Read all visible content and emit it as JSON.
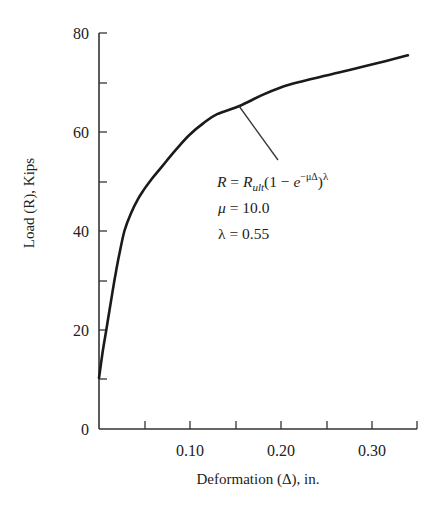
{
  "chart_data": {
    "type": "line",
    "title": "",
    "xlabel": "Deformation (Δ), in.",
    "ylabel": "Load (R), Kips",
    "xlim": [
      0,
      0.35
    ],
    "ylim": [
      0,
      80
    ],
    "grid": false,
    "legend": null,
    "x_ticks": [
      0.05,
      0.1,
      0.15,
      0.2,
      0.25,
      0.3,
      0.35
    ],
    "x_tick_labels": [
      {
        "value": 0.1,
        "label": "0.10"
      },
      {
        "value": 0.2,
        "label": "0.20"
      },
      {
        "value": 0.3,
        "label": "0.30"
      }
    ],
    "y_ticks": [
      10,
      20,
      30,
      40,
      50,
      60,
      70,
      80
    ],
    "y_tick_labels": [
      {
        "value": 0,
        "label": "0"
      },
      {
        "value": 20,
        "label": "20"
      },
      {
        "value": 40,
        "label": "40"
      },
      {
        "value": 60,
        "label": "60"
      },
      {
        "value": 80,
        "label": "80"
      }
    ],
    "series": [
      {
        "name": "Load-deformation curve",
        "x": [
          0.0,
          0.004,
          0.008,
          0.012,
          0.017,
          0.022,
          0.028,
          0.035,
          0.043,
          0.05,
          0.058,
          0.066,
          0.075,
          0.085,
          0.1,
          0.115,
          0.13,
          0.154,
          0.18,
          0.2,
          0.225,
          0.25,
          0.264,
          0.29,
          0.315,
          0.34
        ],
        "y": [
          10.3,
          15.5,
          20.0,
          24.5,
          30.0,
          35.0,
          40.0,
          43.5,
          46.5,
          48.5,
          50.5,
          52.3,
          54.3,
          56.5,
          59.5,
          61.8,
          63.6,
          65.2,
          67.5,
          69.0,
          70.3,
          71.4,
          72.0,
          73.2,
          74.3,
          75.5
        ]
      }
    ],
    "annotations": [
      {
        "text": "R = R_ult(1 − e^(−μΔ))^λ",
        "points_to": {
          "x": 0.153,
          "y": 65.2
        }
      },
      {
        "text": "μ = 10.0"
      },
      {
        "text": "λ = 0.55"
      }
    ]
  },
  "labels": {
    "x_axis_title": "Deformation (Δ), in.",
    "y_axis_title": "Load (R), Kips",
    "y_ticks": [
      "80",
      "60",
      "40",
      "20",
      "0"
    ],
    "x_ticks": [
      "0.10",
      "0.20",
      "0.30"
    ],
    "formula": {
      "lhs": "R",
      "eq": " = ",
      "r": "R",
      "sub": "ult",
      "open": "(1 − ",
      "e": "e",
      "exp": "−μΔ",
      "close": ")",
      "power": "λ"
    },
    "mu_line": {
      "sym": "μ",
      "rest": " = 10.0"
    },
    "lambda_line": {
      "sym": "λ",
      "rest": " = 0.55"
    }
  }
}
